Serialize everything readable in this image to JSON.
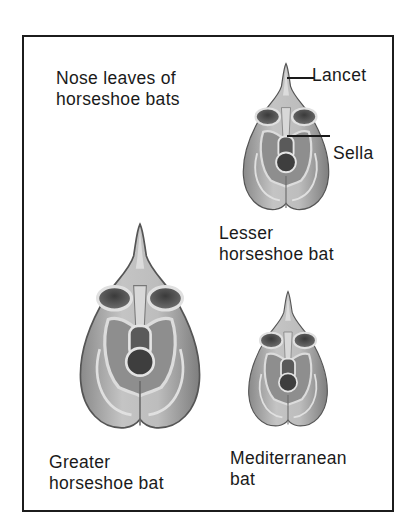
{
  "figure": {
    "title_line1": "Nose leaves of",
    "title_line2": "horseshoe bats",
    "annotations": {
      "lancet": "Lancet",
      "sella": "Sella"
    },
    "specimens": [
      {
        "id": "lesser",
        "name_line1": "Lesser",
        "name_line2": "horseshoe bat",
        "relative_size": "small"
      },
      {
        "id": "greater",
        "name_line1": "Greater",
        "name_line2": "horseshoe bat",
        "relative_size": "large"
      },
      {
        "id": "mediterranean",
        "name_line1": "Mediterranean",
        "name_line2": "bat",
        "relative_size": "smallest"
      }
    ]
  },
  "colors": {
    "border": "#1c1c1c",
    "text": "#1a1a1a",
    "leaf_light": "#c9c9c9",
    "leaf_mid": "#9a9a9a",
    "leaf_dark": "#4a4a4a",
    "background": "#ffffff"
  }
}
